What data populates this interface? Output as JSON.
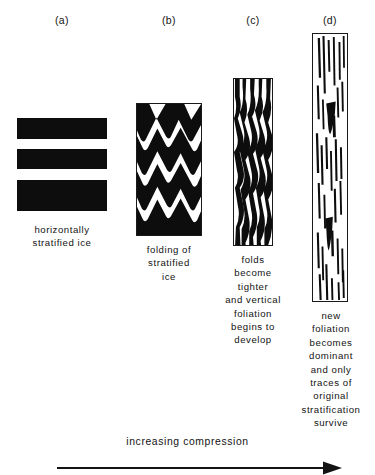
{
  "figure": {
    "panels": [
      {
        "id": "a",
        "label": "(a)",
        "caption": "horizontally\nstratified ice",
        "description": "square block of horizontally stratified ice with three black bands and two white bands",
        "pattern": "horizontal-bands"
      },
      {
        "id": "b",
        "label": "(b)",
        "caption": "folding of\nstratified\nice",
        "description": "upright rectangle of chevron-folded black and white bands",
        "pattern": "chevron-folds"
      },
      {
        "id": "c",
        "label": "(c)",
        "caption": "folds\nbecome\ntighter\nand vertical\nfoliation\nbegins to\ndevelop",
        "description": "narrow tall rectangle of tight near-vertical folds",
        "pattern": "tight-folds"
      },
      {
        "id": "d",
        "label": "(d)",
        "caption": "new\nfoliation\nbecomes\ndominant\nand only\ntraces of\noriginal\nstratification\nsurvive",
        "description": "very tall narrow rectangle of vertical streaks and lenses",
        "pattern": "vertical-foliation"
      }
    ],
    "axis": {
      "label": "increasing compression",
      "direction": "left-to-right"
    },
    "colors": {
      "ice_dark": "#0d0d0d",
      "ice_light": "#ffffff",
      "frame": "#1a1a1a",
      "text": "#131313"
    }
  }
}
